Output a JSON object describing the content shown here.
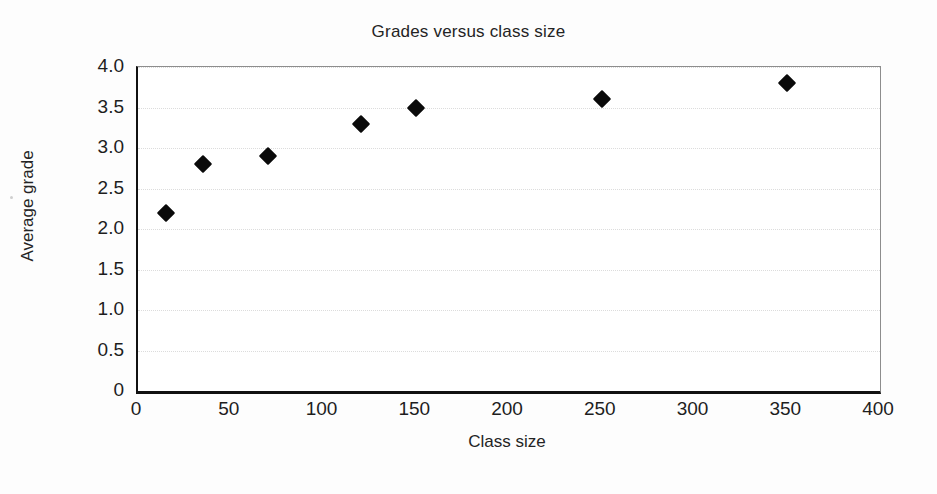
{
  "chart_data": {
    "type": "scatter",
    "title": "Grades versus class size",
    "xlabel": "Class size",
    "ylabel": "Average grade",
    "xlim": [
      0,
      400
    ],
    "ylim": [
      0,
      4.0
    ],
    "grid": "horizontal",
    "legend": "none",
    "marker": "filled-diamond",
    "marker_color": "#0a0a0a",
    "xticks": [
      "0",
      "50",
      "100",
      "150",
      "200",
      "250",
      "300",
      "350",
      "400"
    ],
    "xtick_values": [
      0,
      50,
      100,
      150,
      200,
      250,
      300,
      350,
      400
    ],
    "yticks": [
      "0",
      "0.5",
      "1.0",
      "1.5",
      "2.0",
      "2.5",
      "3.0",
      "3.5",
      "4.0"
    ],
    "ytick_values": [
      0,
      0.5,
      1.0,
      1.5,
      2.0,
      2.5,
      3.0,
      3.5,
      4.0
    ],
    "x": [
      15,
      35,
      70,
      120,
      150,
      250,
      350
    ],
    "y": [
      2.2,
      2.8,
      2.9,
      3.3,
      3.5,
      3.6,
      3.8
    ],
    "points": [
      {
        "x": 15,
        "y": 2.2
      },
      {
        "x": 35,
        "y": 2.8
      },
      {
        "x": 70,
        "y": 2.9
      },
      {
        "x": 120,
        "y": 3.3
      },
      {
        "x": 150,
        "y": 3.5
      },
      {
        "x": 250,
        "y": 3.6
      },
      {
        "x": 350,
        "y": 3.8
      }
    ]
  }
}
